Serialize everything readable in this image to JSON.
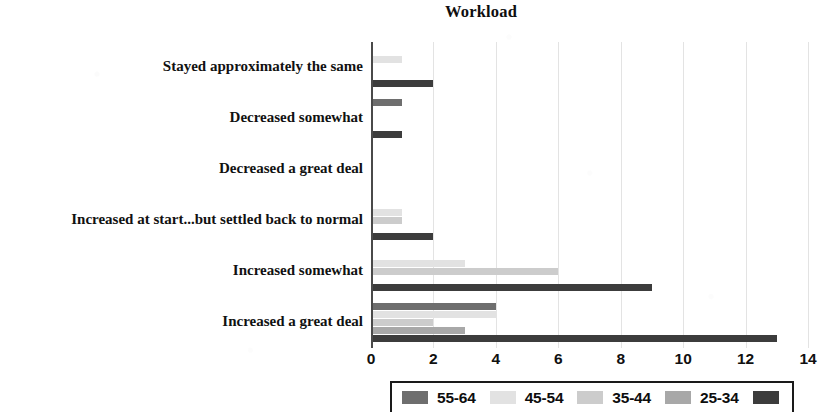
{
  "chart_data": {
    "type": "bar",
    "orientation": "horizontal",
    "title": "Workload",
    "xlabel": "",
    "ylabel": "",
    "xlim": [
      0,
      14
    ],
    "xticks": [
      0,
      2,
      4,
      6,
      8,
      10,
      12,
      14
    ],
    "xtick_labels": [
      "0",
      "2",
      "4",
      "6",
      "8",
      "10",
      "12",
      "14"
    ],
    "grid": "vertical",
    "legend_position": "bottom",
    "categories": [
      "Stayed approximately the same",
      "Decreased somewhat",
      "Decreased a great deal",
      "Increased at start...but settled back to normal",
      "Increased somewhat",
      "Increased a great deal"
    ],
    "series": [
      {
        "name": "55-64",
        "color": "#6e6e6e",
        "values": [
          0,
          1,
          0,
          0,
          0,
          4
        ]
      },
      {
        "name": "45-54",
        "color": "#e2e2e2",
        "values": [
          1,
          0,
          0,
          1,
          3,
          4
        ]
      },
      {
        "name": "35-44",
        "color": "#cccccc",
        "values": [
          0,
          0,
          0,
          1,
          6,
          2
        ]
      },
      {
        "name": "25-34",
        "color": "#a8a8a8",
        "values": [
          0,
          0,
          0,
          0,
          0,
          3
        ]
      },
      {
        "name": "",
        "color": "#3c3c3c",
        "values": [
          2,
          1,
          0,
          2,
          9,
          13
        ]
      }
    ]
  },
  "legend": {
    "entries": [
      {
        "label": "55-64",
        "color": "#6e6e6e"
      },
      {
        "label": "45-54",
        "color": "#e2e2e2"
      },
      {
        "label": "35-44",
        "color": "#cccccc"
      },
      {
        "label": "25-34",
        "color": "#a8a8a8"
      },
      {
        "label": "",
        "color": "#3c3c3c"
      }
    ]
  },
  "colors": {
    "axis": "#4a4a4a",
    "grid": "#e3e3e3",
    "text": "#111111",
    "background": "#ffffff"
  }
}
